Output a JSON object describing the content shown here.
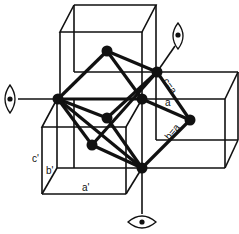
{
  "diagram": {
    "colors": {
      "line": "#111111",
      "background": "#ffffff"
    },
    "labels": {
      "c_eq_a": "c=a",
      "a": "a",
      "b_eq_a": "b=a",
      "c_prime": "c'",
      "b_prime": "b'",
      "a_prime": "a'"
    },
    "viewing_directions": [
      {
        "name": "eye-left",
        "icon": "eye-icon"
      },
      {
        "name": "eye-top-right",
        "icon": "eye-icon"
      },
      {
        "name": "eye-bottom",
        "icon": "eye-icon"
      }
    ],
    "atoms_count": 7
  }
}
